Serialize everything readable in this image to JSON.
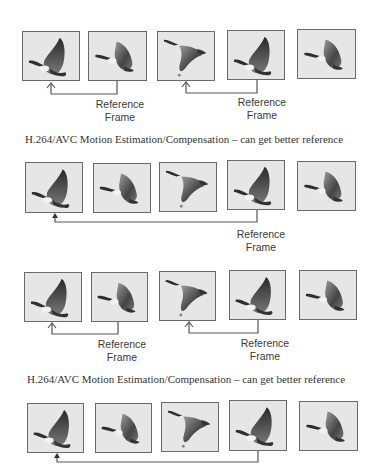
{
  "figure": {
    "panels": [
      {
        "id": "panel-1",
        "frames": [
          {
            "pose": "wings-up"
          },
          {
            "pose": "wings-mid-back"
          },
          {
            "pose": "wings-down"
          },
          {
            "pose": "wings-up"
          },
          {
            "pose": "wings-mid-back"
          }
        ],
        "references": [
          {
            "from_frame": 2,
            "to_frame": 1,
            "label_line1": "Reference",
            "label_line2": "Frame"
          },
          {
            "from_frame": 4,
            "to_frame": 3,
            "label_line1": "Reference",
            "label_line2": "Frame"
          }
        ]
      },
      {
        "id": "panel-2",
        "caption": "H.264/AVC Motion Estimation/Compensation – can get better reference",
        "frames": [
          {
            "pose": "wings-up"
          },
          {
            "pose": "wings-mid-back"
          },
          {
            "pose": "wings-down"
          },
          {
            "pose": "wings-up"
          },
          {
            "pose": "wings-mid-back"
          }
        ],
        "references": [
          {
            "from_frame": 4,
            "to_frame": 1,
            "label_line1": "Reference",
            "label_line2": "Frame"
          }
        ]
      },
      {
        "id": "panel-3",
        "frames": [
          {
            "pose": "wings-up"
          },
          {
            "pose": "wings-mid-back"
          },
          {
            "pose": "wings-down"
          },
          {
            "pose": "wings-up"
          },
          {
            "pose": "wings-mid-back"
          }
        ],
        "references": [
          {
            "from_frame": 2,
            "to_frame": 1,
            "label_line1": "Reference",
            "label_line2": "Frame"
          },
          {
            "from_frame": 4,
            "to_frame": 3,
            "label_line1": "Reference",
            "label_line2": "Frame"
          }
        ]
      },
      {
        "id": "panel-4",
        "caption": "H.264/AVC Motion Estimation/Compensation – can get better reference",
        "frames": [
          {
            "pose": "wings-up"
          },
          {
            "pose": "wings-mid-back"
          },
          {
            "pose": "wings-down"
          },
          {
            "pose": "wings-up"
          },
          {
            "pose": "wings-mid-back"
          }
        ],
        "references": [
          {
            "from_frame": 4,
            "to_frame": 1
          }
        ]
      }
    ],
    "colors": {
      "frame_border": "#6a6a6a",
      "frame_bg": "#e6e6e6",
      "arrow": "#555555",
      "goose_dark": "#2e2e2e",
      "text": "#3a3a3a"
    }
  }
}
